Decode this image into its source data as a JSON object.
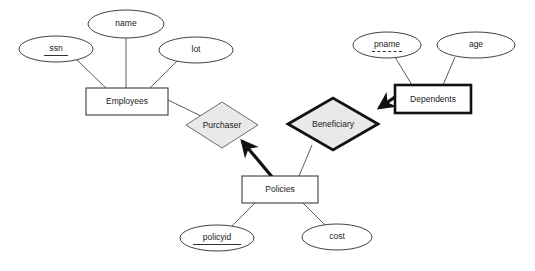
{
  "diagram": {
    "background_color": "#ffffff",
    "diamond_fill": "#e9e9e9",
    "line_color": "#4a4a4a",
    "bold_line_color": "#111111"
  },
  "entities": [
    {
      "id": "employees",
      "label": "Employees",
      "kind": "strong",
      "x": 86,
      "y": 88,
      "w": 82,
      "h": 27
    },
    {
      "id": "dependents",
      "label": "Dependents",
      "kind": "weak",
      "x": 395,
      "y": 85,
      "w": 76,
      "h": 28
    },
    {
      "id": "policies",
      "label": "Policies",
      "kind": "strong",
      "x": 242,
      "y": 176,
      "w": 76,
      "h": 27
    }
  ],
  "relationships": [
    {
      "id": "purchaser",
      "label": "Purchaser",
      "kind": "normal",
      "cx": 222,
      "cy": 125,
      "rx": 36,
      "ry": 23
    },
    {
      "id": "beneficiary",
      "label": "Beneficiary",
      "kind": "identifying",
      "cx": 333,
      "cy": 124,
      "rx": 45,
      "ry": 26
    }
  ],
  "attributes": [
    {
      "id": "ssn",
      "label": "ssn",
      "owner": "employees",
      "key_type": "primary",
      "cx": 56,
      "cy": 49,
      "rx": 37,
      "ry": 13
    },
    {
      "id": "name",
      "label": "name",
      "owner": "employees",
      "key_type": "none",
      "cx": 126,
      "cy": 24,
      "rx": 38,
      "ry": 14
    },
    {
      "id": "lot",
      "label": "lot",
      "owner": "employees",
      "key_type": "none",
      "cx": 196,
      "cy": 50,
      "rx": 37,
      "ry": 13
    },
    {
      "id": "pname",
      "label": "pname",
      "owner": "dependents",
      "key_type": "partial",
      "cx": 387,
      "cy": 45,
      "rx": 34,
      "ry": 13
    },
    {
      "id": "age",
      "label": "age",
      "owner": "dependents",
      "key_type": "none",
      "cx": 476,
      "cy": 45,
      "rx": 39,
      "ry": 13
    },
    {
      "id": "policyid",
      "label": "policyid",
      "owner": "policies",
      "key_type": "primary",
      "cx": 217,
      "cy": 238,
      "rx": 37,
      "ry": 13
    },
    {
      "id": "cost",
      "label": "cost",
      "owner": "policies",
      "key_type": "none",
      "cx": 337,
      "cy": 237,
      "rx": 35,
      "ry": 13
    }
  ],
  "connectors": [
    {
      "id": "ssn-employees",
      "style": "thin",
      "x1": 76,
      "y1": 59,
      "x2": 106,
      "y2": 88
    },
    {
      "id": "name-employees",
      "style": "thin",
      "x1": 126,
      "y1": 38,
      "x2": 126,
      "y2": 88
    },
    {
      "id": "lot-employees",
      "style": "thin",
      "x1": 178,
      "y1": 60,
      "x2": 150,
      "y2": 88
    },
    {
      "id": "pname-dependents",
      "style": "thin",
      "x1": 395,
      "y1": 57,
      "x2": 412,
      "y2": 85
    },
    {
      "id": "age-dependents",
      "style": "thin",
      "x1": 455,
      "y1": 57,
      "x2": 443,
      "y2": 85
    },
    {
      "id": "policies-policyid",
      "style": "thin",
      "x1": 255,
      "y1": 203,
      "x2": 232,
      "y2": 226
    },
    {
      "id": "policies-cost",
      "style": "thin",
      "x1": 303,
      "y1": 203,
      "x2": 325,
      "y2": 225
    },
    {
      "id": "employees-purchaser",
      "style": "thin",
      "x1": 168,
      "y1": 100,
      "x2": 201,
      "y2": 116
    },
    {
      "id": "beneficiary-policies",
      "style": "thin",
      "x1": 312,
      "y1": 145,
      "x2": 299,
      "y2": 176
    },
    {
      "id": "policies-purchaser",
      "style": "arrow-thick",
      "x1": 273,
      "y1": 178,
      "x2": 242,
      "y2": 141
    },
    {
      "id": "dependents-beneficiary",
      "style": "arrow-thick",
      "x1": 395,
      "y1": 97,
      "x2": 379,
      "y2": 108
    }
  ]
}
